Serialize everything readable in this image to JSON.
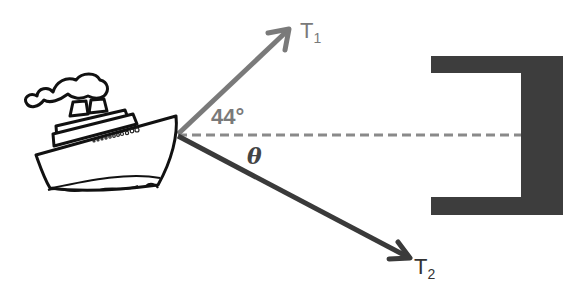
{
  "diagram": {
    "labels": {
      "t1": "T",
      "t1_sub": "1",
      "t2": "T",
      "t2_sub": "2",
      "angle_t1": "44°",
      "angle_t2": "θ"
    },
    "colors": {
      "t1_vector": "#7a7a7a",
      "t2_vector": "#3a3a3a",
      "dock": "#3d3d3d",
      "dashed_line": "#8a8a8a"
    },
    "elements": [
      "ship",
      "vector-t1",
      "vector-t2",
      "horizontal-reference-line",
      "dock"
    ]
  }
}
